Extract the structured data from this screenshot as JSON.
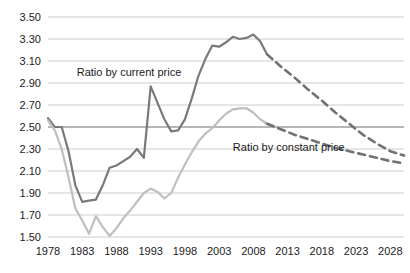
{
  "chart_data": {
    "type": "line",
    "title": "",
    "subtitle": "",
    "xlabel": "",
    "ylabel": "",
    "xlim": [
      1978,
      2030
    ],
    "ylim": [
      1.5,
      3.5
    ],
    "grid": true,
    "legend_position": "inline-annotation",
    "x_ticks": [
      "1978",
      "1983",
      "1988",
      "1993",
      "1998",
      "2003",
      "2008",
      "2013",
      "2018",
      "2023",
      "2028"
    ],
    "x_tick_values": [
      1978,
      1983,
      1988,
      1993,
      1998,
      2003,
      2008,
      2013,
      2018,
      2023,
      2028
    ],
    "y_ticks": [
      "1.50",
      "1.70",
      "1.90",
      "2.10",
      "2.30",
      "2.50",
      "2.70",
      "2.90",
      "3.10",
      "3.30",
      "3.50"
    ],
    "y_tick_values": [
      1.5,
      1.7,
      1.9,
      2.1,
      2.3,
      2.5,
      2.7,
      2.9,
      3.1,
      3.3,
      3.5
    ],
    "emphasized_gridline": 2.5,
    "annotations": [
      {
        "text": "Ratio by current price",
        "x": 1982.2,
        "y": 2.96
      },
      {
        "text": "Ratio by constant price",
        "x": 2005.0,
        "y": 2.28
      }
    ],
    "series": [
      {
        "name": "Ratio by current price",
        "color": "#77797b",
        "style": "solid",
        "width": 2.2,
        "x": [
          1978,
          1979,
          1980,
          1981,
          1982,
          1983,
          1984,
          1985,
          1986,
          1987,
          1988,
          1989,
          1990,
          1991,
          1992,
          1993,
          1994,
          1995,
          1996,
          1997,
          1998,
          1999,
          2000,
          2001,
          2002,
          2003,
          2004,
          2005,
          2006,
          2007,
          2008,
          2009,
          2010
        ],
        "values": [
          2.58,
          2.5,
          2.5,
          2.28,
          1.97,
          1.82,
          1.83,
          1.84,
          1.97,
          2.13,
          2.15,
          2.19,
          2.23,
          2.3,
          2.22,
          2.87,
          2.72,
          2.57,
          2.46,
          2.47,
          2.57,
          2.76,
          2.97,
          3.12,
          3.24,
          3.23,
          3.27,
          3.32,
          3.3,
          3.31,
          3.34,
          3.28,
          3.16
        ]
      },
      {
        "name": "Ratio by current price (forecast)",
        "color": "#6f7173",
        "style": "dashed",
        "width": 2.6,
        "x": [
          2010,
          2012,
          2014,
          2016,
          2018,
          2020,
          2022,
          2024,
          2026,
          2028,
          2030
        ],
        "values": [
          3.16,
          3.05,
          2.95,
          2.84,
          2.74,
          2.63,
          2.53,
          2.43,
          2.35,
          2.28,
          2.24
        ]
      },
      {
        "name": "Ratio by constant price",
        "color": "#bdbfc1",
        "style": "solid",
        "width": 2.2,
        "x": [
          1978,
          1979,
          1980,
          1981,
          1982,
          1983,
          1984,
          1985,
          1986,
          1987,
          1988,
          1989,
          1990,
          1991,
          1992,
          1993,
          1994,
          1995,
          1996,
          1997,
          1998,
          1999,
          2000,
          2001,
          2002,
          2003,
          2004,
          2005,
          2006,
          2007,
          2008,
          2009,
          2010
        ],
        "values": [
          2.56,
          2.47,
          2.3,
          2.04,
          1.76,
          1.65,
          1.53,
          1.69,
          1.59,
          1.51,
          1.58,
          1.67,
          1.74,
          1.82,
          1.9,
          1.94,
          1.91,
          1.85,
          1.9,
          2.04,
          2.16,
          2.27,
          2.37,
          2.44,
          2.49,
          2.56,
          2.62,
          2.66,
          2.67,
          2.67,
          2.63,
          2.57,
          2.53
        ]
      },
      {
        "name": "Ratio by constant price (forecast)",
        "color": "#6f7173",
        "style": "dashed",
        "width": 2.6,
        "x": [
          2010,
          2012,
          2014,
          2016,
          2018,
          2020,
          2022,
          2024,
          2026,
          2028,
          2030
        ],
        "values": [
          2.53,
          2.48,
          2.43,
          2.39,
          2.35,
          2.31,
          2.28,
          2.25,
          2.22,
          2.19,
          2.17
        ]
      }
    ]
  }
}
